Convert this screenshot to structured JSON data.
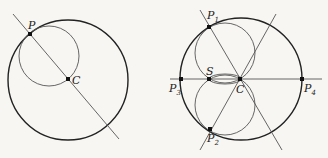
{
  "figures": [
    {
      "id": "left",
      "labels": {
        "P": "P",
        "C": "C"
      },
      "big_circle": {
        "cx": 68,
        "cy": 80,
        "r": 60
      },
      "small_circle": {
        "cx": 49,
        "cy": 56,
        "r": 30
      },
      "line": {
        "x1": 13,
        "y1": 14,
        "x2": 119,
        "y2": 139
      },
      "points": {
        "P": [
          30,
          34
        ],
        "C": [
          68,
          79
        ]
      }
    },
    {
      "id": "right",
      "labels": {
        "P1": "P",
        "P1_sub": "1",
        "P2": "P",
        "P2_sub": "2",
        "P3": "P",
        "P3_sub": "3",
        "P4": "P",
        "P4_sub": "4",
        "S": "S",
        "C": "C"
      },
      "big_circle": {
        "cx": 241,
        "cy": 79,
        "r": 61
      },
      "upper_circle": {
        "cx": 225,
        "cy": 53,
        "r": 30
      },
      "lower_circle": {
        "cx": 225,
        "cy": 105,
        "r": 30
      },
      "lens": {
        "cx": 225,
        "cy": 79,
        "rx": 16,
        "ry": 5
      },
      "lines": [
        {
          "x1": 200,
          "y1": 10,
          "x2": 282,
          "y2": 150
        },
        {
          "x1": 200,
          "y1": 150,
          "x2": 276,
          "y2": 14
        },
        {
          "x1": 170,
          "y1": 79,
          "x2": 322,
          "y2": 79
        }
      ],
      "points": {
        "P1": [
          209,
          27
        ],
        "P2": [
          210,
          129
        ],
        "P3": [
          181,
          79
        ],
        "P4": [
          302,
          79
        ],
        "S": [
          209,
          79
        ],
        "C": [
          240,
          79
        ]
      }
    }
  ]
}
